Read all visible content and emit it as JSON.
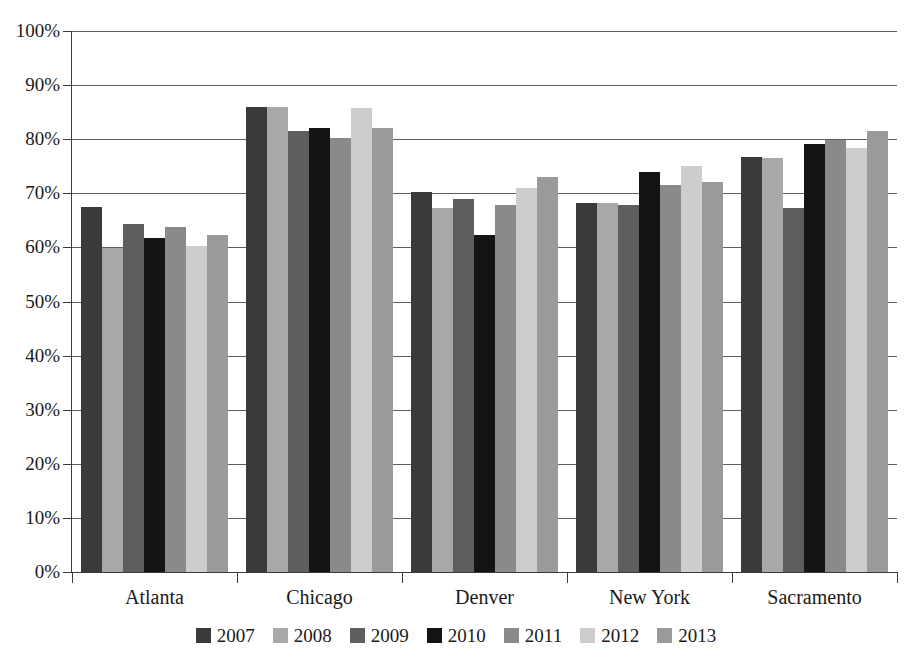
{
  "chart_data": {
    "type": "bar",
    "title": "",
    "xlabel": "",
    "ylabel": "",
    "ylim": [
      0,
      100
    ],
    "ytick_labels": [
      "100%",
      "90%",
      "80%",
      "70%",
      "60%",
      "50%",
      "40%",
      "30%",
      "20%",
      "10%",
      "0%"
    ],
    "ytick_values": [
      100,
      90,
      80,
      70,
      60,
      50,
      40,
      30,
      20,
      10,
      0
    ],
    "grid": true,
    "legend_position": "bottom",
    "categories": [
      "Atlanta",
      "Chicago",
      "Denver",
      "New York",
      "Sacramento"
    ],
    "series": [
      {
        "name": "2007",
        "color": "#3a3a3a",
        "values": [
          67.5,
          86.0,
          70.3,
          68.2,
          76.8
        ]
      },
      {
        "name": "2008",
        "color": "#a8a8a8",
        "values": [
          59.8,
          86.0,
          67.3,
          68.2,
          76.5
        ]
      },
      {
        "name": "2009",
        "color": "#5e5e5e",
        "values": [
          64.3,
          81.5,
          69.0,
          67.8,
          67.3
        ]
      },
      {
        "name": "2010",
        "color": "#141414",
        "values": [
          61.8,
          82.0,
          62.3,
          74.0,
          79.2
        ]
      },
      {
        "name": "2011",
        "color": "#8a8a8a",
        "values": [
          63.8,
          80.2,
          67.8,
          71.5,
          79.8
        ]
      },
      {
        "name": "2012",
        "color": "#cdcdcd",
        "values": [
          60.3,
          85.8,
          71.0,
          75.0,
          78.3
        ]
      },
      {
        "name": "2013",
        "color": "#9a9a9a",
        "values": [
          62.3,
          82.0,
          73.0,
          72.0,
          81.5
        ]
      }
    ]
  }
}
